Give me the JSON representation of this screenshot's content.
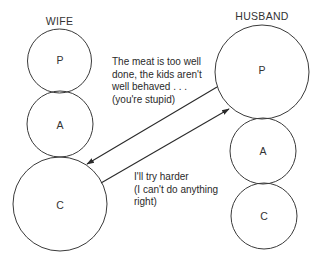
{
  "diagram": {
    "type": "transactional-analysis-crossed-transaction",
    "colors": {
      "line": "#2a2a2a",
      "circle": "#3a3a3a",
      "text": "#2a2a2a",
      "background": "#ffffff"
    },
    "people": [
      {
        "id": "wife",
        "label": "WIFE",
        "states": [
          {
            "id": "wife-p",
            "label": "P",
            "cx": 59.5,
            "cy": 61,
            "r": 32
          },
          {
            "id": "wife-a",
            "label": "A",
            "cx": 60,
            "cy": 124,
            "r": 33
          },
          {
            "id": "wife-c",
            "label": "C",
            "cx": 60,
            "cy": 204,
            "r": 47
          }
        ]
      },
      {
        "id": "husband",
        "label": "HUSBAND",
        "states": [
          {
            "id": "husband-p",
            "label": "P",
            "cx": 262,
            "cy": 72,
            "r": 47
          },
          {
            "id": "husband-a",
            "label": "A",
            "cx": 263,
            "cy": 151,
            "r": 33
          },
          {
            "id": "husband-c",
            "label": "C",
            "cx": 264,
            "cy": 216,
            "r": 33
          }
        ]
      }
    ],
    "transactions": [
      {
        "id": "stimulus",
        "from": "husband-p",
        "to": "wife-c",
        "lines": [
          "The meat is too well",
          "done, the kids aren't",
          "well behaved . . .",
          "(you're stupid)"
        ]
      },
      {
        "id": "response",
        "from": "wife-c",
        "to": "husband-p",
        "lines": [
          "I'll try harder",
          "(I can't do anything",
          "right)"
        ]
      }
    ]
  }
}
